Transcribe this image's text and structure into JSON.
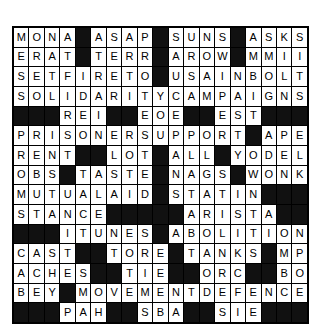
{
  "puzzle": {
    "kind": "crossword-grid",
    "columns": 19,
    "rows": 15,
    "block_color": "#111111",
    "cell_color": "#ffffff",
    "text_color": "#000000",
    "grid": [
      [
        "M",
        "O",
        "N",
        "A",
        "#",
        "A",
        "S",
        "A",
        "P",
        "#",
        "S",
        "U",
        "N",
        "S",
        "#",
        "A",
        "S",
        "K",
        "S"
      ],
      [
        "E",
        "R",
        "A",
        "T",
        "#",
        "T",
        "E",
        "R",
        "R",
        "#",
        "A",
        "R",
        "O",
        "W",
        "#",
        "M",
        "M",
        "I",
        "I"
      ],
      [
        "S",
        "E",
        "T",
        "F",
        "I",
        "R",
        "E",
        "T",
        "O",
        "#",
        "U",
        "S",
        "A",
        "I",
        "N",
        "B",
        "O",
        "L",
        "T"
      ],
      [
        "S",
        "O",
        "L",
        "I",
        "D",
        "A",
        "R",
        "I",
        "T",
        "Y",
        "C",
        "A",
        "M",
        "P",
        "A",
        "I",
        "G",
        "N",
        "S"
      ],
      [
        "#",
        "#",
        "#",
        "R",
        "E",
        "I",
        "#",
        "#",
        "E",
        "O",
        "E",
        "#",
        "#",
        "E",
        "S",
        "T",
        "#",
        "#",
        "#"
      ],
      [
        "P",
        "R",
        "I",
        "S",
        "O",
        "N",
        "E",
        "R",
        "S",
        "U",
        "P",
        "P",
        "O",
        "R",
        "T",
        "#",
        "A",
        "P",
        "E"
      ],
      [
        "R",
        "E",
        "N",
        "T",
        "#",
        "#",
        "L",
        "O",
        "T",
        "#",
        "A",
        "L",
        "L",
        "#",
        "Y",
        "O",
        "D",
        "E",
        "L"
      ],
      [
        "O",
        "B",
        "S",
        "#",
        "T",
        "A",
        "S",
        "T",
        "E",
        "#",
        "N",
        "A",
        "G",
        "S",
        "#",
        "W",
        "O",
        "N",
        "K"
      ],
      [
        "M",
        "U",
        "T",
        "U",
        "A",
        "L",
        "A",
        "I",
        "D",
        "#",
        "S",
        "T",
        "A",
        "T",
        "I",
        "N",
        "#",
        "#",
        "#"
      ],
      [
        "S",
        "T",
        "A",
        "N",
        "C",
        "E",
        "#",
        "#",
        "#",
        "#",
        "#",
        "A",
        "R",
        "I",
        "S",
        "T",
        "A",
        "#",
        "#"
      ],
      [
        "#",
        "#",
        "#",
        "I",
        "T",
        "U",
        "N",
        "E",
        "S",
        "#",
        "A",
        "B",
        "O",
        "L",
        "I",
        "T",
        "I",
        "O",
        "N"
      ],
      [
        "C",
        "A",
        "S",
        "T",
        "#",
        "#",
        "T",
        "O",
        "R",
        "E",
        "#",
        "T",
        "A",
        "N",
        "K",
        "S",
        "#",
        "M",
        "P",
        "G"
      ],
      [
        "A",
        "C",
        "H",
        "E",
        "S",
        "#",
        "#",
        "T",
        "I",
        "E",
        "#",
        "#",
        "O",
        "R",
        "C",
        "#",
        "#",
        "B",
        "O",
        "I",
        "L"
      ],
      [
        "B",
        "E",
        "Y",
        "#",
        "M",
        "O",
        "V",
        "E",
        "M",
        "E",
        "N",
        "T",
        "D",
        "E",
        "F",
        "E",
        "N",
        "C",
        "E"
      ],
      [
        "#",
        "#",
        "#",
        "P",
        "A",
        "H",
        "#",
        "#",
        "S",
        "B",
        "A",
        "#",
        "#",
        "S",
        "I",
        "E",
        "#",
        "#",
        "#"
      ],
      [
        "A",
        "N",
        "A",
        "R",
        "C",
        "H",
        "I",
        "S",
        "T",
        "B",
        "L",
        "A",
        "C",
        "K",
        "C",
        "R",
        "O",
        "S",
        "S"
      ],
      [
        "S",
        "T",
        "R",
        "I",
        "K",
        "E",
        "T",
        "W",
        "O",
        "#",
        "I",
        "M",
        "P",
        "E",
        "A",
        "C",
        "H",
        "E",
        "S"
      ],
      [
        "T",
        "W",
        "I",
        "N",
        "#",
        "#",
        "L",
        "O",
        "A",
        "M",
        "#",
        "T",
        "B",
        "A",
        "R",
        "#",
        "A",
        "I",
        "N",
        "T"
      ],
      [
        "A",
        "T",
        "A",
        "T",
        "#",
        "#",
        "L",
        "O",
        "G",
        "E",
        "#",
        "Y",
        "I",
        "P",
        "S",
        "#",
        "N",
        "O",
        "T",
        "S"
      ]
    ]
  }
}
